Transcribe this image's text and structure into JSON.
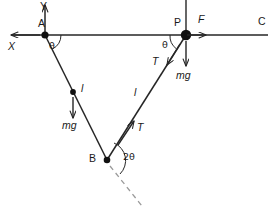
{
  "figure": {
    "type": "physics-free-body-diagram",
    "background_color": "#ffffff",
    "stroke_color": "#262626",
    "dashed_color": "#9a9a9a",
    "points": {
      "A": {
        "label": "A",
        "x": 45,
        "y": 35
      },
      "P": {
        "label": "P",
        "x": 186,
        "y": 35
      },
      "B": {
        "label": "B",
        "x": 107,
        "y": 160
      }
    },
    "axes": {
      "x_label": "X",
      "y_label": "Y",
      "c_label": "C"
    },
    "angles": {
      "at_A": "θ",
      "at_P": "θ",
      "at_B": "2θ"
    },
    "forces": {
      "applied": "F",
      "tension_right_upper": "T",
      "tension_right_lower": "T",
      "weight_left": "mg",
      "weight_right": "mg"
    },
    "lengths": {
      "left_string": "l",
      "right_string": "l"
    }
  }
}
